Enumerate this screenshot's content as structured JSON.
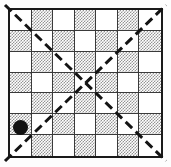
{
  "figure": {
    "caption": "",
    "background_color": "#fdfdfd"
  },
  "board": {
    "rows": 7,
    "columns": 7,
    "frame_color": "#1a1a1a",
    "frame_width_px": 2,
    "gridline_color": "#3a3a3a",
    "light_cell_color": "#ffffff",
    "shaded_cell_color": "#949494",
    "shading_style": "50-percent-dither",
    "pattern_origin": "light",
    "cells": [
      [
        "light",
        "shaded",
        "light",
        "shaded",
        "light",
        "shaded",
        "light"
      ],
      [
        "shaded",
        "light",
        "shaded",
        "light",
        "shaded",
        "light",
        "shaded"
      ],
      [
        "light",
        "shaded",
        "light",
        "shaded",
        "light",
        "shaded",
        "light"
      ],
      [
        "shaded",
        "light",
        "shaded",
        "light",
        "shaded",
        "light",
        "shaded"
      ],
      [
        "light",
        "shaded",
        "light",
        "shaded",
        "light",
        "shaded",
        "light"
      ],
      [
        "shaded",
        "light",
        "shaded",
        "light",
        "shaded",
        "light",
        "shaded"
      ],
      [
        "light",
        "shaded",
        "light",
        "shaded",
        "light",
        "shaded",
        "light"
      ]
    ]
  },
  "diagonals": [
    {
      "name": "main-diagonal",
      "direction": "top-left-to-bottom-right",
      "style": "dashed",
      "color": "#141414",
      "width_px": 3,
      "dash": "9 5",
      "x1": 5,
      "y1": 5,
      "x2": 166,
      "y2": 161
    },
    {
      "name": "anti-diagonal",
      "direction": "bottom-left-to-top-right",
      "style": "dashed",
      "color": "#141414",
      "width_px": 3,
      "dash": "9 5",
      "x1": 5,
      "y1": 161,
      "x2": 166,
      "y2": 5
    }
  ],
  "marker": {
    "name": "marker-dot",
    "shape": "filled-circle",
    "color": "#111111",
    "diameter_px": 15,
    "cell_row": 6,
    "cell_column": 1,
    "cell_shade": "shaded",
    "center_x": 20,
    "center_y": 127
  }
}
